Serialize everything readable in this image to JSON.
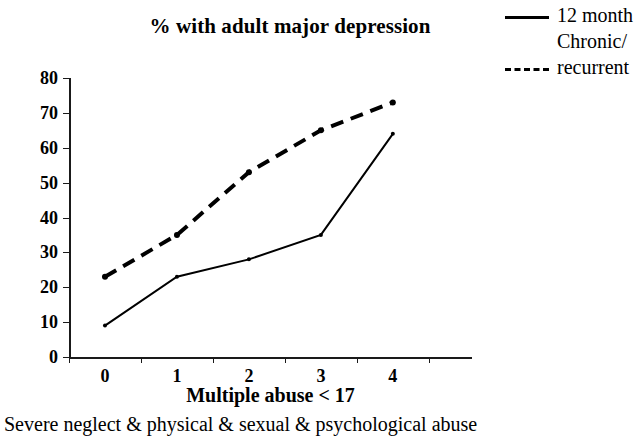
{
  "chart_data": {
    "type": "line",
    "title": "% with adult major depression",
    "xlabel": "Multiple abuse < 17",
    "ylabel": "",
    "caption": "Severe neglect & physical & sexual & psychological abuse",
    "categories": [
      "0",
      "1",
      "2",
      "3",
      "4"
    ],
    "yticks": [
      0,
      10,
      20,
      30,
      40,
      50,
      60,
      70,
      80
    ],
    "ylim": [
      0,
      80
    ],
    "grid": false,
    "legend_position": "top-right",
    "series": [
      {
        "name": "12 month",
        "style": "solid",
        "color": "#000000",
        "values": [
          9,
          23,
          28,
          35,
          64
        ]
      },
      {
        "name": "Chronic/ recurrent",
        "style": "dashed",
        "color": "#000000",
        "values": [
          23,
          35,
          53,
          65,
          73
        ]
      }
    ]
  },
  "legend": {
    "entries": [
      {
        "label": "12 month",
        "label_cont": "",
        "style": "solid"
      },
      {
        "label": "Chronic/",
        "label_cont": "recurrent",
        "style": "dashed"
      }
    ]
  }
}
